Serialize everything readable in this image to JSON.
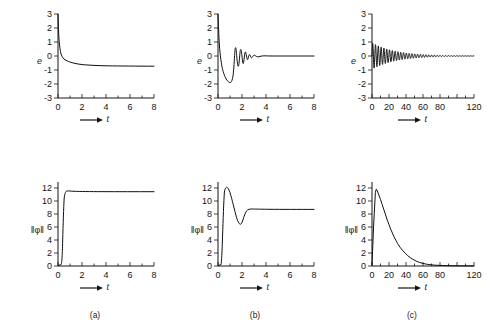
{
  "figure": {
    "background": "#ffffff",
    "ink": "#141414",
    "captions": [
      {
        "id": "a",
        "label": "(a)"
      },
      {
        "id": "b",
        "label": "(b)"
      },
      {
        "id": "c",
        "label": "(c)"
      }
    ],
    "axis_arrow_label": "t"
  },
  "chart_data": [
    {
      "id": "panel-a-error",
      "type": "line",
      "title": "",
      "xlabel": "t",
      "ylabel": "e",
      "xlim": [
        0,
        8
      ],
      "ylim": [
        -3,
        3
      ],
      "xticks": [
        0,
        2,
        4,
        6,
        8
      ],
      "xticklabels": [
        "0",
        "2",
        "4",
        "6",
        "8"
      ],
      "yticks": [
        -3,
        -2,
        -1,
        0,
        1,
        2,
        3
      ],
      "yticklabels": [
        "-3",
        "-2",
        "-1",
        "0",
        "1",
        "2",
        "3"
      ],
      "grid": false,
      "legend": null,
      "series": [
        {
          "name": "e(t)",
          "color": "#111111",
          "x": [
            0.0,
            0.05,
            0.1,
            0.15,
            0.2,
            0.25,
            0.3,
            0.4,
            0.5,
            0.6,
            0.8,
            1.0,
            1.2,
            1.5,
            2.0,
            2.5,
            3.0,
            3.5,
            4.0,
            5.0,
            6.0,
            7.0,
            8.0
          ],
          "y": [
            3.0,
            2.4,
            1.7,
            1.2,
            0.95,
            0.8,
            0.7,
            0.57,
            0.49,
            0.43,
            0.35,
            0.29,
            0.25,
            0.21,
            0.15,
            0.12,
            0.1,
            0.08,
            0.07,
            0.05,
            0.04,
            0.03,
            0.02
          ]
        }
      ]
    },
    {
      "id": "panel-b-error",
      "type": "line",
      "title": "",
      "xlabel": "t",
      "ylabel": "e",
      "xlim": [
        0,
        8
      ],
      "ylim": [
        -3,
        3
      ],
      "xticks": [
        0,
        2,
        4,
        6,
        8
      ],
      "xticklabels": [
        "0",
        "2",
        "4",
        "6",
        "8"
      ],
      "yticks": [
        -3,
        -2,
        -1,
        0,
        1,
        2,
        3
      ],
      "yticklabels": [
        "-3",
        "-2",
        "-1",
        "0",
        "1",
        "2",
        "3"
      ],
      "grid": false,
      "legend": null,
      "series": [
        {
          "name": "e(t)",
          "color": "#111111",
          "x": [
            0.0,
            0.04,
            0.1,
            0.18,
            0.28,
            0.4,
            0.55,
            0.7,
            0.85,
            0.95,
            1.05,
            1.12,
            1.18,
            1.24,
            1.29,
            1.33,
            1.37,
            1.41,
            1.45,
            1.49,
            1.53,
            1.57,
            1.61,
            1.65,
            1.7,
            1.75,
            1.8,
            1.86,
            1.92,
            2.0,
            2.2,
            2.6,
            3.2,
            4.0,
            5.0,
            6.0,
            7.0,
            8.0
          ],
          "y": [
            3.0,
            2.2,
            1.2,
            0.45,
            -0.15,
            -0.72,
            -1.25,
            -1.6,
            -1.78,
            -1.8,
            -1.6,
            -1.2,
            -0.6,
            0.15,
            0.62,
            0.42,
            -0.35,
            -0.72,
            -0.4,
            0.22,
            0.48,
            0.28,
            -0.22,
            -0.45,
            -0.24,
            0.16,
            0.3,
            0.16,
            -0.12,
            -0.1,
            0.06,
            0.03,
            0.01,
            0.0,
            0.0,
            0.0,
            0.0,
            0.0
          ]
        }
      ]
    },
    {
      "id": "panel-c-error",
      "type": "line",
      "title": "",
      "xlabel": "t",
      "ylabel": "e",
      "xlim": [
        0,
        120
      ],
      "ylim": [
        -3,
        3
      ],
      "xticks": [
        0,
        20,
        40,
        60,
        80,
        100,
        120
      ],
      "xticklabels": [
        "0",
        "20",
        "40",
        "60",
        "80",
        "",
        "120"
      ],
      "yticks": [
        -3,
        -2,
        -1,
        0,
        1,
        2,
        3
      ],
      "yticklabels": [
        "-3",
        "-2",
        "-1",
        "0",
        "1",
        "2",
        "3"
      ],
      "grid": false,
      "legend": null,
      "description": "decaying sinusoidal oscillation, initial amplitude about 0.95, period about 3.3, envelope decays to zero near t = 85",
      "oscillation": {
        "amplitude0": 0.95,
        "period": 3.3,
        "decay_time_constant": 27,
        "t_start": 0,
        "t_end": 120
      },
      "series": [
        {
          "name": "e(t)",
          "color": "#111111",
          "x": [
            0,
            10,
            20,
            30,
            40,
            50,
            60,
            70,
            80,
            90,
            100,
            110,
            120
          ],
          "y_envelope": [
            0.95,
            0.88,
            0.78,
            0.64,
            0.5,
            0.38,
            0.27,
            0.18,
            0.11,
            0.06,
            0.03,
            0.01,
            0.0
          ]
        }
      ]
    },
    {
      "id": "panel-a-norm",
      "type": "line",
      "title": "",
      "xlabel": "t",
      "ylabel": "‖φ‖",
      "xlim": [
        0,
        8
      ],
      "ylim": [
        0,
        13
      ],
      "xticks": [
        0,
        2,
        4,
        6,
        8
      ],
      "xticklabels": [
        "0",
        "2",
        "4",
        "6",
        "8"
      ],
      "yticks": [
        0,
        2,
        4,
        6,
        8,
        10,
        12
      ],
      "yticklabels": [
        "0",
        "2",
        "4",
        "6",
        "8",
        "10",
        "12"
      ],
      "grid": false,
      "legend": null,
      "series": [
        {
          "name": "||phi(t)||",
          "color": "#111111",
          "x": [
            0.0,
            0.25,
            0.35,
            0.42,
            0.48,
            0.52,
            0.58,
            0.65,
            0.75,
            0.9,
            1.1,
            1.4,
            2.0,
            3.0,
            4.0,
            5.0,
            6.0,
            7.0,
            8.0
          ],
          "y": [
            0.1,
            0.2,
            1.2,
            4.0,
            7.6,
            9.8,
            11.0,
            11.35,
            11.4,
            11.35,
            11.32,
            11.3,
            11.3,
            11.3,
            11.3,
            11.3,
            11.3,
            11.3,
            11.3
          ]
        }
      ]
    },
    {
      "id": "panel-b-norm",
      "type": "line",
      "title": "",
      "xlabel": "t",
      "ylabel": "‖φ‖",
      "xlim": [
        0,
        8
      ],
      "ylim": [
        0,
        13
      ],
      "xticks": [
        0,
        2,
        4,
        6,
        8
      ],
      "xticklabels": [
        "0",
        "2",
        "4",
        "6",
        "8"
      ],
      "yticks": [
        0,
        2,
        4,
        6,
        8,
        10,
        12
      ],
      "yticklabels": [
        "0",
        "2",
        "4",
        "6",
        "8",
        "10",
        "12"
      ],
      "grid": false,
      "legend": null,
      "series": [
        {
          "name": "||phi(t)||",
          "color": "#111111",
          "x": [
            0.0,
            0.25,
            0.32,
            0.38,
            0.44,
            0.5,
            0.58,
            0.68,
            0.8,
            0.92,
            1.02,
            1.1,
            1.18,
            1.26,
            1.33,
            1.4,
            1.48,
            1.56,
            1.66,
            1.8,
            2.0,
            2.4,
            3.0,
            4.0,
            5.0,
            6.0,
            7.0,
            8.0
          ],
          "y": [
            0.1,
            0.2,
            2.0,
            6.0,
            9.5,
            11.5,
            12.1,
            12.0,
            11.5,
            10.6,
            9.5,
            8.4,
            7.4,
            6.7,
            6.45,
            6.9,
            7.9,
            8.55,
            8.75,
            8.75,
            8.72,
            8.7,
            8.7,
            8.7,
            8.7,
            8.7,
            8.7,
            8.7
          ]
        }
      ]
    },
    {
      "id": "panel-c-norm",
      "type": "line",
      "title": "",
      "xlabel": "t",
      "ylabel": "‖φ‖",
      "xlim": [
        0,
        120
      ],
      "ylim": [
        0,
        13
      ],
      "xticks": [
        0,
        20,
        40,
        60,
        80,
        100,
        120
      ],
      "xticklabels": [
        "0",
        "20",
        "40",
        "60",
        "80",
        "",
        "120"
      ],
      "yticks": [
        0,
        2,
        4,
        6,
        8,
        10,
        12
      ],
      "yticklabels": [
        "0",
        "2",
        "4",
        "6",
        "8",
        "10",
        "12"
      ],
      "grid": false,
      "legend": null,
      "series": [
        {
          "name": "||phi(t)||",
          "color": "#111111",
          "x": [
            0,
            2,
            4,
            5,
            6,
            8,
            10,
            12,
            14,
            16,
            18,
            20,
            22,
            24,
            26,
            28,
            30,
            33,
            36,
            39,
            42,
            45,
            48,
            52,
            56,
            60,
            65,
            70,
            75,
            80,
            90,
            100,
            110,
            120
          ],
          "y": [
            0.2,
            6.5,
            11.4,
            11.9,
            11.7,
            11.0,
            10.3,
            9.5,
            8.7,
            7.9,
            7.1,
            6.4,
            5.7,
            5.1,
            4.5,
            4.0,
            3.5,
            2.9,
            2.4,
            2.0,
            1.6,
            1.3,
            1.05,
            0.75,
            0.55,
            0.4,
            0.26,
            0.18,
            0.12,
            0.09,
            0.05,
            0.03,
            0.02,
            0.01
          ]
        }
      ]
    }
  ]
}
